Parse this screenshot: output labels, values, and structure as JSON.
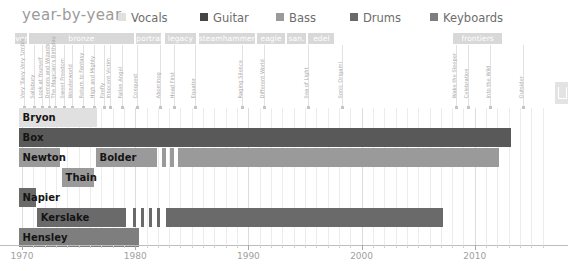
{
  "chart_data": {
    "type": "bar",
    "title": "year-by-year",
    "xlabel": "",
    "ylabel": "",
    "xlim": [
      1969,
      2016
    ],
    "grid": true,
    "legend_position": "top",
    "orientation": "horizontal-timeline",
    "tick_labels": [
      "1970",
      "1980",
      "1990",
      "2000",
      "2010"
    ],
    "tick_values": [
      1970,
      1980,
      1990,
      2000,
      2010
    ],
    "legend": [
      {
        "name": "Vocals",
        "color": "#e0e0e0"
      },
      {
        "name": "Guitar",
        "color": "#454545"
      },
      {
        "name": "Bass",
        "color": "#9a9a9a"
      },
      {
        "name": "Drums",
        "color": "#6a6a6a"
      },
      {
        "name": "Keyboards",
        "color": "#7e7e7e"
      }
    ],
    "categories": [
      "Bryon",
      "Box",
      "Newton",
      "Bolder",
      "Thain",
      "Napier",
      "Kerslake",
      "Hensley"
    ],
    "series": [
      {
        "name": "Bryon",
        "role": "Vocals",
        "color": "#e0e0e0",
        "label": "Bryon",
        "lane": 0,
        "segments": [
          {
            "start": 1969.7,
            "end": 1976.6
          }
        ]
      },
      {
        "name": "Box",
        "role": "Guitar",
        "color": "#595959",
        "label": "Box",
        "lane": 1,
        "segments": [
          {
            "start": 1969.7,
            "end": 2013.2
          }
        ]
      },
      {
        "name": "Newton",
        "role": "Bass",
        "color": "#9a9a9a",
        "label": "Newton",
        "lane": 2,
        "segments": [
          {
            "start": 1969.7,
            "end": 1973.4
          }
        ]
      },
      {
        "name": "Bolder",
        "role": "Bass",
        "color": "#9a9a9a",
        "label": "Bolder",
        "lane": 2,
        "segments": [
          {
            "start": 1976.5,
            "end": 1981.9
          },
          {
            "start": 1982.4,
            "end": 1982.7
          },
          {
            "start": 1983.1,
            "end": 1983.4
          },
          {
            "start": 1983.8,
            "end": 2012.1
          }
        ]
      },
      {
        "name": "Thain",
        "role": "Bass",
        "color": "#9a9a9a",
        "label": "Thain",
        "lane": 3,
        "segments": [
          {
            "start": 1973.5,
            "end": 1976.4
          }
        ]
      },
      {
        "name": "Napier",
        "role": "Drums",
        "color": "#6a6a6a",
        "label": "Napier",
        "lane": 4,
        "segments": [
          {
            "start": 1969.7,
            "end": 1971.2
          }
        ]
      },
      {
        "name": "Kerslake",
        "role": "Drums",
        "color": "#6a6a6a",
        "label": "Kerslake",
        "lane": 5,
        "segments": [
          {
            "start": 1971.3,
            "end": 1979.2
          },
          {
            "start": 1979.8,
            "end": 1980.1
          },
          {
            "start": 1980.5,
            "end": 1980.8
          },
          {
            "start": 1981.2,
            "end": 1981.5
          },
          {
            "start": 1981.9,
            "end": 1982.2
          },
          {
            "start": 1982.7,
            "end": 2007.2
          }
        ]
      },
      {
        "name": "Hensley",
        "role": "Keyboards",
        "color": "#7e7e7e",
        "label": "Hensley",
        "lane": 6,
        "segments": [
          {
            "start": 1969.7,
            "end": 1980.3
          }
        ]
      }
    ],
    "eras": [
      {
        "label": "ver.",
        "start": 1969.4,
        "end": 1970.4
      },
      {
        "label": "bronze",
        "start": 1970.6,
        "end": 1979.9
      },
      {
        "label": "portrait",
        "start": 1980.1,
        "end": 1982.3
      },
      {
        "label": "legacy",
        "start": 1982.6,
        "end": 1985.4
      },
      {
        "label": "steamhammer",
        "start": 1985.6,
        "end": 1990.6
      },
      {
        "label": "eagle",
        "start": 1990.8,
        "end": 1993.2
      },
      {
        "label": "san.",
        "start": 1993.4,
        "end": 1995.1
      },
      {
        "label": "edel",
        "start": 1995.3,
        "end": 1997.6
      },
      {
        "label": "frontiers",
        "start": 2008.1,
        "end": 2012.4
      }
    ],
    "albums": [
      {
        "label": "Very 'Eavy Very 'Umble",
        "year": 1970.2
      },
      {
        "label": "Salisbury",
        "year": 1971.1
      },
      {
        "label": "Look at Yourself",
        "year": 1971.8
      },
      {
        "label": "Demons and Wizards",
        "year": 1972.4
      },
      {
        "label": "The Magician's Birthday",
        "year": 1972.9
      },
      {
        "label": "Sweet Freedom",
        "year": 1973.7
      },
      {
        "label": "Wonderworld",
        "year": 1974.4
      },
      {
        "label": "Return to Fantasy",
        "year": 1975.4
      },
      {
        "label": "High and Mighty",
        "year": 1976.4
      },
      {
        "label": "Firefly",
        "year": 1977.2
      },
      {
        "label": "Innocent Victim",
        "year": 1977.8
      },
      {
        "label": "Fallen Angel",
        "year": 1978.8
      },
      {
        "label": "Conquest",
        "year": 1980.2
      },
      {
        "label": "Abominog",
        "year": 1982.2
      },
      {
        "label": "Head First",
        "year": 1983.4
      },
      {
        "label": "Equator",
        "year": 1985.3
      },
      {
        "label": "Raging Silence",
        "year": 1989.4
      },
      {
        "label": "Different World",
        "year": 1991.4
      },
      {
        "label": "Sea of Light",
        "year": 1995.3
      },
      {
        "label": "Sonic Origami",
        "year": 1998.3
      },
      {
        "label": "Wake the Sleeper",
        "year": 2008.3
      },
      {
        "label": "Celebration",
        "year": 2009.4
      },
      {
        "label": "Into the Wild",
        "year": 2011.3
      },
      {
        "label": "Outsider",
        "year": 2014.3
      }
    ]
  },
  "edge_tab": {
    "glyph": "panel-toggle"
  }
}
